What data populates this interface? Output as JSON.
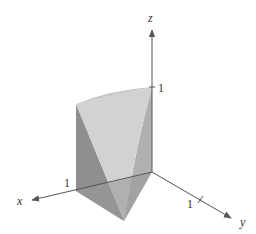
{
  "diagram": {
    "type": "3d-solid-region",
    "axes": {
      "x": {
        "label": "x",
        "tick_label": "1"
      },
      "y": {
        "label": "y",
        "tick_label": "1"
      },
      "z": {
        "label": "z",
        "tick_label": "1"
      }
    },
    "colors": {
      "axis": "#555555",
      "face_dark": "#8c8c8c",
      "face_mid": "#a6a6a6",
      "face_light": "#d4d4d4",
      "face_back": "#b8b8b8"
    }
  }
}
